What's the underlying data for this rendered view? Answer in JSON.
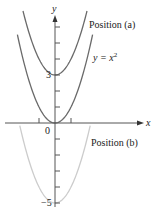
{
  "chart_data": {
    "type": "line",
    "title": "",
    "xlabel": "x",
    "ylabel": "y",
    "xlim": [
      -3.1,
      5.3
    ],
    "ylim": [
      -5.5,
      7.1
    ],
    "grid": false,
    "y_tick_labels": [
      {
        "value": 3,
        "label": "3"
      },
      {
        "value": -5,
        "label": "−5"
      }
    ],
    "x_tick_labels": [
      {
        "value": 0,
        "label": "0"
      }
    ],
    "y_ticks": [
      -5,
      -4,
      -3,
      -2,
      -1,
      1,
      2,
      3,
      4,
      5,
      6
    ],
    "x_ticks": [
      -1,
      1
    ],
    "series": [
      {
        "name": "Position (a)",
        "equation": "y = x^2 + 3",
        "color": "#6a6a6a",
        "x_range": [
          -2.0,
          2.0
        ]
      },
      {
        "name": "y = x^2",
        "equation": "y = x^2",
        "color": "#6a6a6a",
        "x_range": [
          -2.35,
          2.35
        ]
      },
      {
        "name": "Position (b)",
        "equation": "y = x^2 - 5",
        "color": "#cccccc",
        "x_range": [
          -2.2,
          2.2
        ]
      }
    ],
    "annotations": [
      {
        "text": "Position (a)",
        "x": 2.1,
        "y": 6.1
      },
      {
        "text": "y = x",
        "superscript": "2",
        "x": 2.3,
        "y": 4.0
      },
      {
        "text": "Position (b)",
        "x": 2.2,
        "y": -1.2
      }
    ]
  },
  "labels": {
    "x_axis": "x",
    "y_axis": "y",
    "origin": "0",
    "tick_3": "3",
    "tick_neg5": "−5",
    "position_a": "Position (a)",
    "position_b": "Position (b)",
    "eq_base": "y = x",
    "eq_exp": "2"
  }
}
